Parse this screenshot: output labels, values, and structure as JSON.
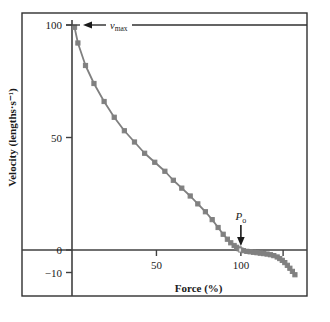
{
  "chart_data": {
    "type": "line",
    "title": "",
    "xlabel": "Force (%)",
    "ylabel": "Velocity (lengths·s⁻¹)",
    "xlim": [
      0,
      135
    ],
    "ylim": [
      -13,
      103
    ],
    "xticks": [
      50,
      100,
      125
    ],
    "xtick_labels": [
      "50",
      "100",
      ""
    ],
    "yticks": [
      100,
      50,
      0,
      -10
    ],
    "ytick_labels": [
      "100",
      "50",
      "0",
      "−10"
    ],
    "grid": false,
    "legend": "none",
    "marker": "square",
    "series": [
      {
        "name": "force-velocity",
        "x": [
          1.5,
          3.5,
          8,
          13,
          19,
          25,
          31,
          37,
          43,
          49,
          55,
          60,
          65,
          70,
          74.5,
          79,
          83,
          86.5,
          89.5,
          92,
          94,
          96,
          97.5,
          99,
          100,
          101.5,
          103.5,
          105.5,
          107.5,
          109.5,
          111.5,
          113.5,
          115.5,
          117.5,
          119.5,
          121.5,
          123,
          124.5,
          126,
          127.5,
          129,
          130.5,
          132
        ],
        "y": [
          99,
          92,
          82,
          74,
          66,
          59,
          53,
          48,
          43,
          39,
          35,
          31,
          27.5,
          24,
          20.5,
          17,
          13.5,
          10,
          7,
          4.8,
          3.2,
          2,
          1.2,
          0.5,
          0,
          -0.3,
          -0.6,
          -0.8,
          -1,
          -1.2,
          -1.4,
          -1.6,
          -1.8,
          -2.1,
          -2.5,
          -3.1,
          -3.8,
          -4.6,
          -5.6,
          -6.8,
          -8.1,
          -9.5,
          -11
        ]
      }
    ],
    "annotations": [
      {
        "name": "vmax",
        "label": "v",
        "sub": "max",
        "value_axis": "y",
        "value": 100
      },
      {
        "name": "p0",
        "label": "P",
        "sub": "o",
        "value_axis": "x",
        "value": 100
      }
    ],
    "colors": {
      "curve": "#808080",
      "axis": "#404040",
      "frame": "#303030",
      "text": "#1a1a1a"
    }
  }
}
